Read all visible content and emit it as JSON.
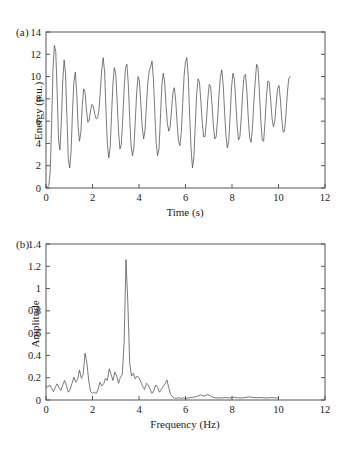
{
  "figure": {
    "panels": [
      {
        "id": "a",
        "label": "(a)",
        "xlabel": "Time (s)",
        "ylabel": "Energy (p.u.)"
      },
      {
        "id": "b",
        "label": "(b)",
        "xlabel": "Frequency (Hz)",
        "ylabel": "Amplitude"
      }
    ],
    "line_color": "#4d4d4d",
    "axis_color": "#555555"
  },
  "chart_data": [
    {
      "type": "line",
      "panel": "(a)",
      "title": "",
      "xlabel": "Time (s)",
      "ylabel": "Energy (p.u.)",
      "xlim": [
        0,
        12
      ],
      "ylim": [
        0,
        14
      ],
      "xticks": [
        0,
        2,
        4,
        6,
        8,
        10,
        12
      ],
      "yticks": [
        0,
        2,
        4,
        6,
        8,
        10,
        12,
        14
      ],
      "grid": false,
      "legend": "none",
      "description": "Oscillatory energy signal, mean about 7 p.u., envelope roughly 2 to 12 p.u., dominant oscillation near 3.4 Hz, record ends near t = 10.5 s",
      "x": [
        0.0,
        0.06,
        0.12,
        0.18,
        0.24,
        0.3,
        0.36,
        0.42,
        0.48,
        0.54,
        0.6,
        0.66,
        0.72,
        0.78,
        0.84,
        0.9,
        0.96,
        1.02,
        1.08,
        1.14,
        1.2,
        1.26,
        1.32,
        1.38,
        1.44,
        1.5,
        1.56,
        1.62,
        1.68,
        1.74,
        1.8,
        1.86,
        1.92,
        1.98,
        2.04,
        2.1,
        2.16,
        2.22,
        2.28,
        2.34,
        2.4,
        2.46,
        2.52,
        2.58,
        2.64,
        2.7,
        2.76,
        2.82,
        2.88,
        2.94,
        3.0,
        3.06,
        3.12,
        3.18,
        3.24,
        3.3,
        3.36,
        3.42,
        3.48,
        3.54,
        3.6,
        3.66,
        3.72,
        3.78,
        3.84,
        3.9,
        3.96,
        4.02,
        4.08,
        4.14,
        4.2,
        4.26,
        4.32,
        4.38,
        4.44,
        4.5,
        4.56,
        4.62,
        4.68,
        4.74,
        4.8,
        4.86,
        4.92,
        4.98,
        5.04,
        5.1,
        5.16,
        5.22,
        5.28,
        5.34,
        5.4,
        5.46,
        5.52,
        5.58,
        5.64,
        5.7,
        5.76,
        5.82,
        5.88,
        5.94,
        6.0,
        6.06,
        6.12,
        6.18,
        6.24,
        6.3,
        6.36,
        6.42,
        6.48,
        6.54,
        6.6,
        6.66,
        6.72,
        6.78,
        6.84,
        6.9,
        6.96,
        7.02,
        7.08,
        7.14,
        7.2,
        7.26,
        7.32,
        7.38,
        7.44,
        7.5,
        7.56,
        7.62,
        7.68,
        7.74,
        7.8,
        7.86,
        7.92,
        7.98,
        8.04,
        8.1,
        8.16,
        8.22,
        8.28,
        8.34,
        8.4,
        8.46,
        8.52,
        8.58,
        8.64,
        8.7,
        8.76,
        8.82,
        8.88,
        8.94,
        9.0,
        9.06,
        9.12,
        9.18,
        9.24,
        9.3,
        9.36,
        9.42,
        9.48,
        9.54,
        9.6,
        9.66,
        9.72,
        9.78,
        9.84,
        9.9,
        9.96,
        10.02,
        10.08,
        10.14,
        10.2,
        10.26,
        10.32,
        10.38,
        10.44,
        10.5
      ],
      "y": [
        0.1,
        0.1,
        0.2,
        1.4,
        5.6,
        10.6,
        12.8,
        12.2,
        8.6,
        4.3,
        3.4,
        5.9,
        9.6,
        11.5,
        10.3,
        6.4,
        2.6,
        1.8,
        3.3,
        6.9,
        9.5,
        10.4,
        8.6,
        5.6,
        4.2,
        5.0,
        7.4,
        8.9,
        8.6,
        7.0,
        5.9,
        6.1,
        7.0,
        7.5,
        7.3,
        6.6,
        6.2,
        6.3,
        7.0,
        8.8,
        10.7,
        11.7,
        10.4,
        7.0,
        3.9,
        2.7,
        3.6,
        6.6,
        9.4,
        10.8,
        10.2,
        7.8,
        5.1,
        3.5,
        3.9,
        6.2,
        8.9,
        10.8,
        11.1,
        9.3,
        6.3,
        3.8,
        2.9,
        3.6,
        6.0,
        8.6,
        10.0,
        9.6,
        7.5,
        5.4,
        4.4,
        5.2,
        7.4,
        9.5,
        10.5,
        10.9,
        11.4,
        9.8,
        6.8,
        4.0,
        2.9,
        3.5,
        6.2,
        9.1,
        10.3,
        9.6,
        7.5,
        5.8,
        5.1,
        5.5,
        7.0,
        8.6,
        9.0,
        7.8,
        5.8,
        4.2,
        3.8,
        5.0,
        7.6,
        10.1,
        11.3,
        11.7,
        9.9,
        6.4,
        3.5,
        1.8,
        2.7,
        5.6,
        8.4,
        9.8,
        9.5,
        7.8,
        5.9,
        4.6,
        4.6,
        6.0,
        8.0,
        9.3,
        9.1,
        7.5,
        5.6,
        4.4,
        4.6,
        6.2,
        8.3,
        10.0,
        10.6,
        9.3,
        6.9,
        4.7,
        3.6,
        4.2,
        6.5,
        9.0,
        10.3,
        9.8,
        7.8,
        5.6,
        4.3,
        4.6,
        6.4,
        8.6,
        10.0,
        10.2,
        8.7,
        6.3,
        4.5,
        4.1,
        5.4,
        7.7,
        9.6,
        11.1,
        10.8,
        8.6,
        6.0,
        4.3,
        4.2,
        5.9,
        8.2,
        9.6,
        9.5,
        8.0,
        6.3,
        5.5,
        6.0,
        7.5,
        8.9,
        9.2,
        8.0,
        6.2,
        5.0,
        5.1,
        6.6,
        8.5,
        9.8,
        10.0,
        8.6,
        6.4,
        4.8,
        4.6,
        6.0,
        8.3,
        10.1,
        10.6,
        9.2,
        6.7,
        4.5,
        3.4,
        4.0,
        6.4,
        9.0,
        10.7,
        11.2,
        9.8,
        7.0,
        4.6,
        3.5,
        4.3,
        6.8,
        9.3,
        10.8,
        10.4,
        8.4,
        6.1,
        4.7,
        4.8,
        6.5,
        8.7,
        10.1,
        10.2,
        8.8,
        6.7,
        5.3,
        5.3,
        6.8,
        8.5,
        9.6,
        9.4,
        7.9,
        6.4,
        5.8,
        6.3,
        7.6,
        8.8,
        9.0,
        8.1,
        6.9,
        6.3,
        6.6,
        7.6,
        8.5,
        8.7,
        8.0,
        7.0,
        6.4,
        6.6,
        7.4,
        8.2,
        8.4,
        7.8,
        6.7,
        5.6,
        5.0,
        5.4,
        6.8,
        8.4,
        9.5,
        9.4,
        8.1,
        6.3,
        5.0,
        4.8,
        5.9,
        7.7,
        9.3,
        10.0,
        9.3,
        7.4,
        5.4,
        4.2,
        4.5,
        6.3,
        8.6,
        10.2,
        11.2,
        12.0,
        10.9,
        8.0,
        5.0,
        3.1,
        2.9,
        4.6,
        7.3,
        9.5,
        10.4,
        9.6,
        7.6,
        5.8,
        5.0,
        5.6,
        7.2,
        8.6,
        8.9,
        7.9,
        6.7,
        6.2,
        6.6,
        7.6,
        8.2,
        8.0,
        7.0,
        6.0,
        5.6,
        6.1,
        7.3,
        8.5,
        9.0,
        8.3,
        6.8,
        5.5,
        4.9,
        5.4,
        6.9,
        8.6,
        9.5,
        9.0,
        7.4,
        5.9,
        5.2,
        5.7,
        7.2,
        8.8,
        9.4,
        8.5,
        6.7,
        5.1,
        4.4,
        5.1,
        7.1,
        9.3,
        10.7,
        11.4,
        10.4,
        7.9,
        5.3,
        3.6,
        3.3,
        4.8,
        7.2,
        9.2,
        10.4,
        10.1,
        8.2,
        6.0,
        4.4,
        3.8,
        4.7,
        6.8,
        8.9,
        10.4,
        10.0,
        7.9,
        5.4,
        3.6,
        3.0
      ]
    },
    {
      "type": "line",
      "panel": "(b)",
      "title": "",
      "xlabel": "Frequency (Hz)",
      "ylabel": "Amplitude",
      "xlim": [
        0,
        12
      ],
      "ylim": [
        0,
        1.4
      ],
      "xticks": [
        0,
        2,
        4,
        6,
        8,
        10,
        12
      ],
      "yticks": [
        0,
        0.2,
        0.4,
        0.6,
        0.8,
        1,
        1.2,
        1.4
      ],
      "grid": false,
      "legend": "none",
      "description": "Amplitude spectrum of panel (a). Dominant narrow peak of about 1.26 at 3.4 Hz; secondary peak about 0.42 near 1.7 Hz; broadband content below 5.5 Hz; near-zero ripple above 6 Hz, spectrum drawn to 10 Hz",
      "peaks": [
        {
          "frequency": 3.4,
          "amplitude": 1.26
        },
        {
          "frequency": 1.68,
          "amplitude": 0.42
        },
        {
          "frequency": 2.72,
          "amplitude": 0.28
        },
        {
          "frequency": 1.48,
          "amplitude": 0.27
        },
        {
          "frequency": 5.22,
          "amplitude": 0.18
        }
      ],
      "x": [
        0.0,
        0.08,
        0.16,
        0.24,
        0.32,
        0.4,
        0.48,
        0.56,
        0.64,
        0.72,
        0.8,
        0.88,
        0.96,
        1.04,
        1.12,
        1.2,
        1.28,
        1.36,
        1.44,
        1.52,
        1.6,
        1.68,
        1.76,
        1.84,
        1.92,
        2.0,
        2.08,
        2.16,
        2.24,
        2.32,
        2.4,
        2.48,
        2.56,
        2.64,
        2.72,
        2.8,
        2.88,
        2.96,
        3.04,
        3.12,
        3.2,
        3.28,
        3.36,
        3.44,
        3.52,
        3.6,
        3.68,
        3.76,
        3.84,
        3.92,
        4.0,
        4.08,
        4.16,
        4.24,
        4.32,
        4.4,
        4.48,
        4.56,
        4.64,
        4.72,
        4.8,
        4.88,
        4.96,
        5.04,
        5.12,
        5.2,
        5.28,
        5.36,
        5.44,
        5.52,
        5.6,
        5.68,
        5.76,
        5.84,
        5.92,
        6.0,
        6.16,
        6.32,
        6.48,
        6.64,
        6.8,
        6.96,
        7.12,
        7.28,
        7.44,
        7.6,
        7.76,
        7.92,
        8.08,
        8.24,
        8.4,
        8.56,
        8.72,
        8.88,
        9.04,
        9.2,
        9.36,
        9.52,
        9.68,
        9.84,
        10.0
      ],
      "y": [
        0.125,
        0.115,
        0.135,
        0.105,
        0.075,
        0.115,
        0.145,
        0.11,
        0.085,
        0.135,
        0.175,
        0.13,
        0.07,
        0.095,
        0.15,
        0.205,
        0.16,
        0.185,
        0.27,
        0.195,
        0.23,
        0.42,
        0.33,
        0.17,
        0.075,
        0.06,
        0.07,
        0.06,
        0.095,
        0.16,
        0.125,
        0.145,
        0.195,
        0.175,
        0.28,
        0.23,
        0.175,
        0.25,
        0.215,
        0.15,
        0.205,
        0.225,
        0.52,
        1.26,
        0.87,
        0.33,
        0.215,
        0.24,
        0.19,
        0.215,
        0.2,
        0.16,
        0.12,
        0.095,
        0.15,
        0.135,
        0.095,
        0.06,
        0.085,
        0.135,
        0.115,
        0.07,
        0.095,
        0.12,
        0.145,
        0.18,
        0.11,
        0.05,
        0.03,
        0.02,
        0.015,
        0.02,
        0.018,
        0.016,
        0.018,
        0.015,
        0.02,
        0.025,
        0.03,
        0.045,
        0.035,
        0.05,
        0.03,
        0.02,
        0.018,
        0.02,
        0.022,
        0.018,
        0.025,
        0.02,
        0.018,
        0.022,
        0.028,
        0.024,
        0.02,
        0.022,
        0.02,
        0.018,
        0.022,
        0.02,
        0.018
      ]
    }
  ]
}
